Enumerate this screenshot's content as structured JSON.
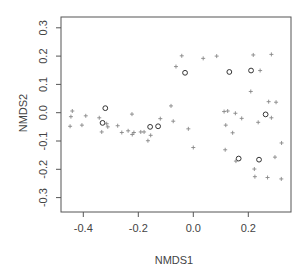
{
  "chart_data": {
    "type": "scatter",
    "title": "",
    "xlabel": "NMDS1",
    "ylabel": "NMDS2",
    "xlim": [
      -0.47,
      0.355
    ],
    "ylim": [
      -0.355,
      0.34
    ],
    "xticks": [
      -0.4,
      -0.2,
      0.0,
      0.2
    ],
    "xtick_labels": [
      "-0.4",
      "-0.2",
      "0.0",
      "0.2"
    ],
    "yticks": [
      -0.3,
      -0.2,
      -0.1,
      0.0,
      0.1,
      0.2,
      0.3
    ],
    "ytick_labels": [
      "-0.3",
      "-0.2",
      "-0.1",
      "0.0",
      "0.1",
      "0.2",
      "0.3"
    ],
    "grid": false,
    "legend": null,
    "series": [
      {
        "name": "sites",
        "marker": "circle",
        "color": "#333333",
        "points": [
          [
            -0.32,
            0.016
          ],
          [
            -0.33,
            -0.036
          ],
          [
            -0.157,
            -0.05
          ],
          [
            -0.128,
            -0.048
          ],
          [
            -0.03,
            0.141
          ],
          [
            0.131,
            0.144
          ],
          [
            0.21,
            0.149
          ],
          [
            0.263,
            -0.006
          ],
          [
            0.165,
            -0.162
          ],
          [
            0.239,
            -0.166
          ]
        ]
      },
      {
        "name": "species",
        "marker": "plus",
        "color": "#888888",
        "points": [
          [
            -0.44,
            0.006
          ],
          [
            -0.445,
            -0.014
          ],
          [
            -0.448,
            -0.048
          ],
          [
            -0.391,
            -0.011
          ],
          [
            -0.405,
            -0.044
          ],
          [
            -0.342,
            -0.018
          ],
          [
            -0.315,
            -0.039
          ],
          [
            -0.311,
            -0.05
          ],
          [
            -0.333,
            -0.068
          ],
          [
            -0.275,
            -0.046
          ],
          [
            -0.26,
            -0.07
          ],
          [
            -0.237,
            -0.064
          ],
          [
            -0.223,
            -0.005
          ],
          [
            -0.222,
            -0.077
          ],
          [
            -0.216,
            -0.07
          ],
          [
            -0.191,
            -0.068
          ],
          [
            -0.179,
            -0.068
          ],
          [
            -0.165,
            -0.099
          ],
          [
            -0.155,
            -0.08
          ],
          [
            -0.12,
            -0.021
          ],
          [
            -0.081,
            0.024
          ],
          [
            -0.073,
            -0.03
          ],
          [
            -0.063,
            0.163
          ],
          [
            -0.042,
            0.201
          ],
          [
            -0.018,
            -0.057
          ],
          [
            0.0,
            -0.123
          ],
          [
            0.036,
            0.192
          ],
          [
            0.085,
            0.2
          ],
          [
            0.112,
            0.004
          ],
          [
            0.125,
            0.006
          ],
          [
            0.118,
            -0.044
          ],
          [
            0.116,
            -0.131
          ],
          [
            0.143,
            -0.071
          ],
          [
            0.153,
            -0.002
          ],
          [
            0.155,
            -0.171
          ],
          [
            0.176,
            -0.02
          ],
          [
            0.209,
            0.075
          ],
          [
            0.218,
            0.204
          ],
          [
            0.222,
            -0.199
          ],
          [
            0.224,
            -0.226
          ],
          [
            0.236,
            -0.034
          ],
          [
            0.243,
            0.149
          ],
          [
            0.27,
            -0.229
          ],
          [
            0.274,
            0.039
          ],
          [
            0.284,
            0.206
          ],
          [
            0.284,
            -0.018
          ],
          [
            0.297,
            -0.157
          ],
          [
            0.301,
            0.037
          ],
          [
            0.321,
            -0.107
          ],
          [
            0.32,
            -0.234
          ]
        ]
      }
    ]
  }
}
